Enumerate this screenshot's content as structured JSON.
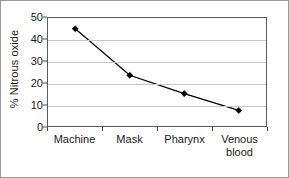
{
  "chart_data": {
    "type": "line",
    "title": "",
    "xlabel": "",
    "ylabel": "% Nitrous oxide",
    "categories": [
      "Machine",
      "Mask",
      "Pharynx",
      "Venous blood"
    ],
    "category_lines": [
      [
        "Machine"
      ],
      [
        "Mask"
      ],
      [
        "Pharynx"
      ],
      [
        "Venous",
        "blood"
      ]
    ],
    "values": [
      45,
      23.5,
      15,
      7.2
    ],
    "ylim": [
      0,
      50
    ],
    "yticks": [
      0,
      10,
      20,
      30,
      40,
      50
    ],
    "ytick_labels": [
      "0",
      "10",
      "20",
      "30",
      "40",
      "50"
    ],
    "grid": true,
    "grid_axis": "y",
    "legend": "none",
    "marker": "diamond",
    "line_color": "#000000",
    "marker_color": "#000000",
    "grid_color": "#c8c8c8",
    "axis_color": "#5a5a5a",
    "background": "#ffffff"
  }
}
